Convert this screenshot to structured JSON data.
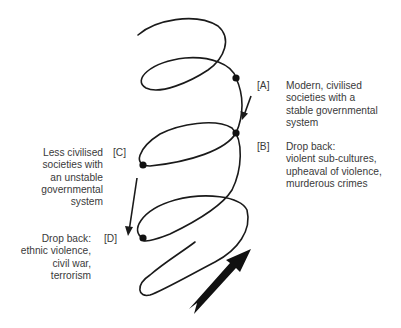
{
  "diagram": {
    "type": "downward spiral with drop-back points",
    "stroke_color": "#1a1a1a",
    "text_color": "#3a3a3a",
    "points": [
      {
        "tag": "[A]",
        "lines": [
          "Modern, civilised",
          "societies with a",
          "stable governmental",
          "system"
        ]
      },
      {
        "tag": "[B]",
        "lines": [
          "Drop back:",
          "violent sub-cultures,",
          "upheaval of violence,",
          "murderous crimes"
        ]
      },
      {
        "tag": "[C]",
        "lines": [
          "Less civilised",
          "societies with",
          "an unstable",
          "governmental",
          "system"
        ]
      },
      {
        "tag": "[D]",
        "lines": [
          "Drop back:",
          "ethnic violence,",
          "civil war,",
          "terrorism"
        ]
      }
    ]
  }
}
